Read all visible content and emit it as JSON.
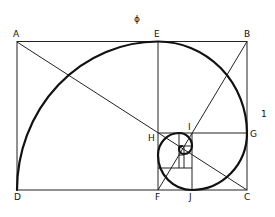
{
  "diagram": {
    "top_label": "ϕ",
    "side_label": "1",
    "points": {
      "A": {
        "label": "A",
        "x": 17,
        "y": 42
      },
      "B": {
        "label": "B",
        "x": 247,
        "y": 41
      },
      "C": {
        "label": "C",
        "x": 247,
        "y": 190
      },
      "D": {
        "label": "D",
        "x": 17,
        "y": 190
      },
      "E": {
        "label": "E",
        "x": 158,
        "y": 41
      },
      "F": {
        "label": "F",
        "x": 158,
        "y": 190
      },
      "G": {
        "label": "G",
        "x": 247,
        "y": 133
      },
      "H": {
        "label": "H",
        "x": 158,
        "y": 133
      },
      "I": {
        "label": "I",
        "x": 192,
        "y": 133
      },
      "J": {
        "label": "J",
        "x": 192,
        "y": 190
      }
    },
    "colors": {
      "lines": "#222222",
      "spiral": "#111111",
      "background": "#ffffff"
    }
  }
}
